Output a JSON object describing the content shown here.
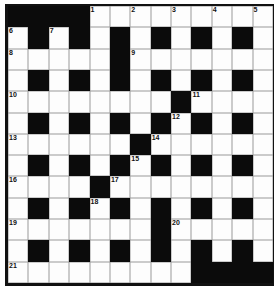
{
  "puzzle": {
    "rows": 13,
    "cols": 13,
    "colors": {
      "black": "#0b0b0b",
      "white": "#fdfdfd",
      "line": "#9a9a9a"
    },
    "layout": [
      "####.........",
      ".#.#.#.#.#.#.",
      ".....#.......",
      ".#.#.#.#.#.#.",
      "........#....",
      ".#.#.#.#.#.#.",
      "......#......",
      ".#.#.#.#.#.#.",
      "....#........",
      ".#.#.#.#.#.#.",
      ".......#.....",
      ".#.#.#.#.#.#.",
      ".........####"
    ],
    "numbers": [
      {
        "r": 0,
        "c": 4,
        "n": "1"
      },
      {
        "r": 0,
        "c": 6,
        "n": "2"
      },
      {
        "r": 0,
        "c": 8,
        "n": "3"
      },
      {
        "r": 0,
        "c": 10,
        "n": "4"
      },
      {
        "r": 0,
        "c": 12,
        "n": "5"
      },
      {
        "r": 1,
        "c": 0,
        "n": "6"
      },
      {
        "r": 1,
        "c": 2,
        "n": "7"
      },
      {
        "r": 2,
        "c": 0,
        "n": "8"
      },
      {
        "r": 2,
        "c": 6,
        "n": "9"
      },
      {
        "r": 4,
        "c": 0,
        "n": "10"
      },
      {
        "r": 4,
        "c": 9,
        "n": "11"
      },
      {
        "r": 5,
        "c": 8,
        "n": "12"
      },
      {
        "r": 6,
        "c": 0,
        "n": "13"
      },
      {
        "r": 6,
        "c": 7,
        "n": "14"
      },
      {
        "r": 7,
        "c": 6,
        "n": "15"
      },
      {
        "r": 8,
        "c": 0,
        "n": "16"
      },
      {
        "r": 8,
        "c": 5,
        "n": "17"
      },
      {
        "r": 9,
        "c": 4,
        "n": "18"
      },
      {
        "r": 10,
        "c": 0,
        "n": "19"
      },
      {
        "r": 10,
        "c": 8,
        "n": "20"
      },
      {
        "r": 12,
        "c": 0,
        "n": "21"
      }
    ]
  }
}
